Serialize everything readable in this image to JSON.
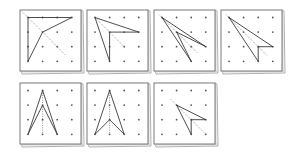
{
  "figure": {
    "colors": {
      "stroke": "#3a3a3a",
      "peg": "#555555",
      "board_edge": "#6a6a6a",
      "shadow": "#9a9a9a",
      "dotted": "#777777"
    },
    "grid": {
      "rows": 4,
      "cols": 4
    }
  },
  "boards": [
    {
      "id": "board-1",
      "x": 20,
      "y": 10,
      "w": 61,
      "h": 61,
      "shape": [
        [
          0,
          0
        ],
        [
          3,
          0
        ],
        [
          1,
          1
        ],
        [
          0,
          3
        ]
      ],
      "dotted": [
        [
          -0.4,
          -0.4
        ],
        [
          2.6,
          2.6
        ]
      ]
    },
    {
      "id": "board-2",
      "x": 87,
      "y": 10,
      "w": 61,
      "h": 61,
      "shape": [
        [
          0,
          0
        ],
        [
          3,
          1
        ],
        [
          1,
          1
        ],
        [
          1,
          3
        ]
      ],
      "dotted": [
        [
          0,
          0
        ],
        [
          2,
          2
        ]
      ]
    },
    {
      "id": "board-3",
      "x": 154,
      "y": 10,
      "w": 61,
      "h": 61,
      "shape": [
        [
          0,
          0
        ],
        [
          3,
          2
        ],
        [
          1,
          1
        ],
        [
          2,
          3
        ]
      ],
      "dotted": [
        [
          -0.2,
          -0.2
        ],
        [
          2.4,
          2.4
        ]
      ]
    },
    {
      "id": "board-4",
      "x": 221,
      "y": 10,
      "w": 61,
      "h": 61,
      "shape": [
        [
          0,
          0
        ],
        [
          3,
          2
        ],
        [
          2,
          2
        ],
        [
          2,
          3
        ]
      ],
      "dotted": [
        [
          -0.2,
          -0.2
        ],
        [
          2.6,
          2.6
        ]
      ]
    },
    {
      "id": "board-5",
      "x": 20,
      "y": 83,
      "w": 61,
      "h": 61,
      "shape": [
        [
          1,
          0
        ],
        [
          2,
          3
        ],
        [
          1,
          1
        ],
        [
          0,
          3
        ]
      ],
      "dotted": [
        [
          1,
          0
        ],
        [
          1,
          3
        ]
      ]
    },
    {
      "id": "board-6",
      "x": 87,
      "y": 83,
      "w": 61,
      "h": 61,
      "shape": [
        [
          1,
          0
        ],
        [
          2,
          3
        ],
        [
          1,
          2
        ],
        [
          0,
          3
        ]
      ],
      "dotted": [
        [
          1,
          0
        ],
        [
          1,
          3
        ]
      ]
    },
    {
      "id": "board-7",
      "x": 154,
      "y": 83,
      "w": 61,
      "h": 61,
      "shape": [
        [
          1,
          1
        ],
        [
          3,
          2
        ],
        [
          2,
          2
        ],
        [
          2,
          3
        ]
      ],
      "dotted": [
        [
          0.6,
          0.6
        ],
        [
          3,
          3
        ]
      ]
    }
  ]
}
